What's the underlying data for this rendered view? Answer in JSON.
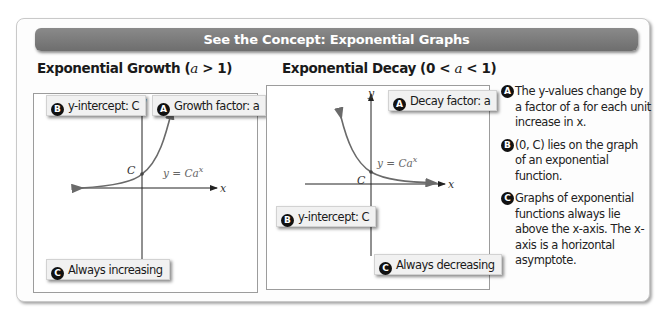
{
  "banner": {
    "title": "See the Concept: Exponential Graphs"
  },
  "growth": {
    "title_prefix": "Exponential Growth (",
    "title_var": "a",
    "title_suffix": " > 1)",
    "callouts": {
      "b": {
        "badge": "B",
        "label": "y-intercept: C"
      },
      "a": {
        "badge": "A",
        "label": "Growth factor: a"
      },
      "c": {
        "badge": "C",
        "label": "Always increasing"
      }
    },
    "axis_x": "x",
    "axis_y": "y",
    "intercept_label": "C",
    "equation": "y = Ca",
    "equation_exp": "x"
  },
  "decay": {
    "title_prefix": "Exponential Decay (0 < ",
    "title_var": "a",
    "title_suffix": " < 1)",
    "callouts": {
      "a": {
        "badge": "A",
        "label": "Decay factor: a"
      },
      "b": {
        "badge": "B",
        "label": "y-intercept: C"
      },
      "c": {
        "badge": "C",
        "label": "Always decreasing"
      }
    },
    "axis_x": "x",
    "axis_y": "y",
    "intercept_label": "C",
    "equation": "y = Ca",
    "equation_exp": "x"
  },
  "notes": [
    {
      "badge": "A",
      "text": "The y-values change by a factor of a for each unit increase in x."
    },
    {
      "badge": "B",
      "text": "(0, C) lies on the graph of an exponential function."
    },
    {
      "badge": "C",
      "text": "Graphs of exponential functions always lie above the x-axis. The x-axis is a horizontal asymptote."
    }
  ],
  "colors": {
    "banner": "#7a7a7a",
    "curve": "#6a6a6a",
    "axis": "#222222"
  }
}
